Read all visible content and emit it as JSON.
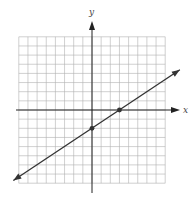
{
  "chart_data": {
    "type": "line",
    "title": "",
    "xlabel": "x",
    "ylabel": "y",
    "xlim": [
      -8,
      8
    ],
    "ylim": [
      -8,
      8
    ],
    "grid": true,
    "grid_step": 1,
    "series": [
      {
        "name": "line",
        "equation": "y = (2/3)x - 2",
        "slope": 0.6667,
        "intercept": -2,
        "x": [
          -8.6,
          9.6
        ],
        "y": [
          -7.7,
          4.4
        ]
      }
    ],
    "points": [
      {
        "x": 0,
        "y": -2,
        "label": "y-intercept"
      },
      {
        "x": 3,
        "y": 0,
        "label": "x-intercept"
      }
    ]
  },
  "axes": {
    "x_label": "x",
    "y_label": "y"
  },
  "colors": {
    "grid": "#b0b0b0",
    "axis": "#222222",
    "line": "#333333",
    "point": "#333333"
  }
}
